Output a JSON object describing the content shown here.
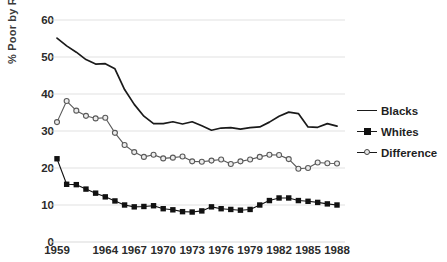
{
  "chart_data": {
    "type": "line",
    "title": "",
    "xlabel": "",
    "ylabel": "% Poor by Race",
    "ylim": [
      0,
      60
    ],
    "yticks": [
      0,
      10,
      20,
      30,
      40,
      50,
      60
    ],
    "grid": true,
    "legend_position": "right",
    "x": [
      1959,
      1960,
      1961,
      1962,
      1963,
      1964,
      1965,
      1966,
      1967,
      1968,
      1969,
      1970,
      1971,
      1972,
      1973,
      1974,
      1975,
      1976,
      1977,
      1978,
      1979,
      1980,
      1981,
      1982,
      1983,
      1984,
      1985,
      1986,
      1987,
      1988
    ],
    "xtick_labels": [
      "1959",
      "1964",
      "1967",
      "1970",
      "1973",
      "1976",
      "1979",
      "1982",
      "1985",
      "1988"
    ],
    "xtick_values": [
      1959,
      1964,
      1967,
      1970,
      1973,
      1976,
      1979,
      1982,
      1985,
      1988
    ],
    "series": [
      {
        "name": "Blacks",
        "marker": "none",
        "color": "#1a1a1a",
        "values": [
          55.1,
          53.0,
          51.3,
          49.3,
          48.1,
          48.2,
          46.8,
          41.2,
          37.2,
          34.0,
          32.0,
          32.0,
          32.5,
          31.9,
          32.5,
          31.4,
          30.2,
          30.8,
          30.9,
          30.5,
          30.9,
          31.1,
          32.4,
          34.0,
          35.1,
          34.7,
          31.1,
          31.0,
          32.0,
          31.3
        ]
      },
      {
        "name": "Whites",
        "marker": "square",
        "color": "#111111",
        "values": [
          22.5,
          15.6,
          15.5,
          14.3,
          13.2,
          12.2,
          11.1,
          10.0,
          9.5,
          9.6,
          9.8,
          9.0,
          8.7,
          8.2,
          8.1,
          8.4,
          9.5,
          9.0,
          8.8,
          8.6,
          8.8,
          10.0,
          11.2,
          11.9,
          11.9,
          11.2,
          11.0,
          10.7,
          10.3,
          10.0
        ]
      },
      {
        "name": "Difference",
        "marker": "circle",
        "color": "#5a5a5a",
        "values": [
          32.4,
          38.1,
          35.5,
          34.1,
          33.4,
          33.6,
          29.5,
          26.2,
          24.3,
          23.0,
          23.6,
          22.6,
          22.8,
          23.1,
          21.8,
          21.7,
          22.0,
          22.3,
          21.1,
          21.8,
          22.3,
          23.0,
          23.6,
          23.5,
          22.4,
          19.8,
          20.0,
          21.5,
          21.3,
          21.2
        ]
      }
    ]
  },
  "axes": {
    "y_label": "% Poor by Race"
  },
  "legend": {
    "items": [
      {
        "label": "Blacks",
        "key": "line"
      },
      {
        "label": "Whites",
        "key": "line-square"
      },
      {
        "label": "Difference",
        "key": "line-circle"
      }
    ]
  },
  "colors": {
    "blacks_line": "#1a1a1a",
    "whites_line": "#111111",
    "difference_line": "#5a5a5a",
    "gridline": "#d9d9d9",
    "text": "#1f1f1f",
    "background": "#ffffff"
  }
}
